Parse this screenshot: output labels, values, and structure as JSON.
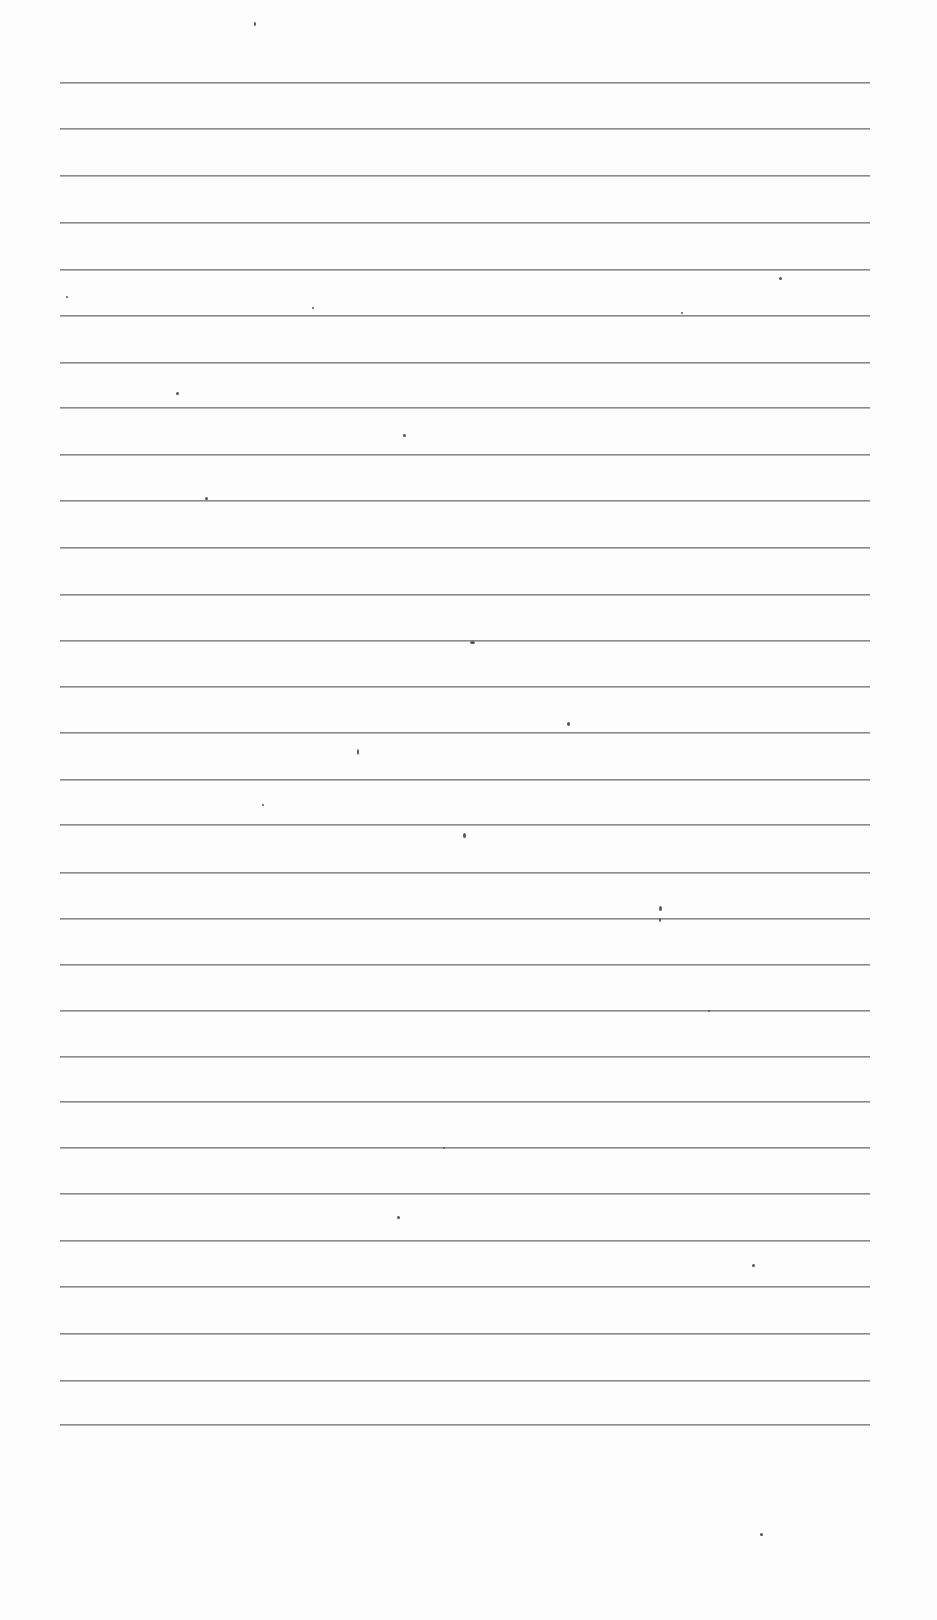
{
  "page": {
    "type": "blank lined paper",
    "line_color": "#8a8a8a",
    "background_color": "#fdfdfd",
    "line_left_x": 60,
    "line_right_x": 870,
    "line_count": 30,
    "line_positions_y": [
      82,
      128,
      175,
      222,
      269,
      315,
      362,
      407,
      454,
      500,
      547,
      594,
      640,
      686,
      732,
      779,
      824,
      872,
      918,
      964,
      1010,
      1056,
      1101,
      1147,
      1193,
      1240,
      1286,
      1333,
      1380,
      1424
    ],
    "specks": [
      [
        254,
        22,
        2,
        4
      ],
      [
        470,
        641,
        5,
        3
      ],
      [
        567,
        722,
        3,
        4
      ],
      [
        357,
        749,
        2,
        6
      ],
      [
        659,
        906,
        3,
        5
      ],
      [
        659,
        918,
        2,
        4
      ],
      [
        397,
        1216,
        3,
        3
      ],
      [
        205,
        497,
        3,
        3
      ],
      [
        176,
        392,
        3,
        3
      ],
      [
        403,
        434,
        3,
        3
      ],
      [
        779,
        277,
        3,
        3
      ],
      [
        752,
        1264,
        3,
        3
      ],
      [
        760,
        1533,
        3,
        3
      ],
      [
        312,
        307,
        2,
        2
      ],
      [
        681,
        312,
        2,
        2
      ],
      [
        463,
        833,
        3,
        5
      ],
      [
        262,
        804,
        2,
        2
      ],
      [
        708,
        1010,
        2,
        2
      ],
      [
        443,
        1147,
        2,
        2
      ],
      [
        66,
        296,
        2,
        2
      ]
    ]
  }
}
